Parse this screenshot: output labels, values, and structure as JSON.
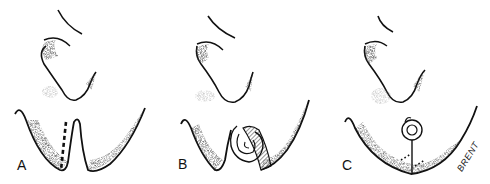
{
  "figure": {
    "panels": [
      {
        "id": "A",
        "label": "A",
        "description": "ear and earlobe region with dashed incision line beside cleft"
      },
      {
        "id": "B",
        "label": "B",
        "description": "rotated spiral flap with hatched area in cleft"
      },
      {
        "id": "C",
        "label": "C",
        "description": "closed repair with spiral and solid line with dotted suture marks"
      }
    ],
    "signature": "BRENT",
    "colors": {
      "ink": "#111111",
      "stipple": "#555555",
      "background": "#ffffff"
    }
  }
}
